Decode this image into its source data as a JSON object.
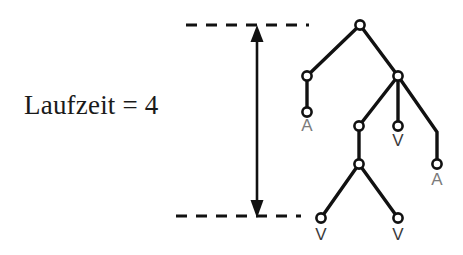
{
  "figure": {
    "background_color": "#ffffff",
    "ink_color": "#111111",
    "caption": {
      "text": "Laufzeit = 4",
      "x": 24,
      "y": 90
    },
    "depth_indicator": {
      "arrow_x": 257,
      "arrow_top_y": 27,
      "arrow_bottom_y": 217,
      "double_headed": true,
      "top_dashed_line": {
        "x1": 186,
        "x2": 309,
        "y": 25
      },
      "bottom_dashed_line": {
        "x1": 176,
        "x2": 301,
        "y": 216
      }
    },
    "tree": {
      "node_radius": 4.6,
      "nodes": [
        {
          "id": "root",
          "x": 360,
          "y": 25,
          "label": ""
        },
        {
          "id": "n-left",
          "x": 307,
          "y": 76,
          "label": ""
        },
        {
          "id": "n-right",
          "x": 398,
          "y": 76,
          "label": ""
        },
        {
          "id": "leaf-a-left",
          "x": 307,
          "y": 112,
          "label": "A",
          "label_color": "#7b7b7b"
        },
        {
          "id": "n-mid",
          "x": 359,
          "y": 126,
          "label": ""
        },
        {
          "id": "leaf-v-mid",
          "x": 398,
          "y": 126,
          "label": "V",
          "label_color": "#3b3b3b"
        },
        {
          "id": "n-lower",
          "x": 359,
          "y": 164,
          "label": ""
        },
        {
          "id": "leaf-a-right",
          "x": 437,
          "y": 164,
          "label": "A",
          "label_color": "#7b7b7b"
        },
        {
          "id": "leaf-v-bottom-left",
          "x": 321,
          "y": 218,
          "label": "V",
          "label_color": "#3b3b3b"
        },
        {
          "id": "leaf-v-bottom-right",
          "x": 398,
          "y": 218,
          "label": "V",
          "label_color": "#3b3b3b"
        }
      ],
      "edges": [
        {
          "from": "root",
          "to": "n-left"
        },
        {
          "from": "root",
          "to": "n-right"
        },
        {
          "from": "n-left",
          "to": "leaf-a-left"
        },
        {
          "from": "n-right",
          "to": "n-mid"
        },
        {
          "from": "n-right",
          "to": "leaf-v-mid"
        },
        {
          "from": "n-right",
          "to": "leaf-a-right",
          "bend": {
            "x": 437,
            "y": 132
          }
        },
        {
          "from": "n-mid",
          "to": "n-lower"
        },
        {
          "from": "n-lower",
          "to": "leaf-v-bottom-left"
        },
        {
          "from": "n-lower",
          "to": "leaf-v-bottom-right"
        }
      ],
      "labels": [
        {
          "for": "leaf-a-left",
          "text": "A",
          "x": 307,
          "y": 131,
          "color": "#7b7b7b"
        },
        {
          "for": "leaf-v-mid",
          "text": "V",
          "x": 398,
          "y": 146,
          "color": "#3b3b3b"
        },
        {
          "for": "leaf-a-right",
          "text": "A",
          "x": 437,
          "y": 185,
          "color": "#7b7b7b"
        },
        {
          "for": "leaf-v-bottom-left",
          "text": "V",
          "x": 321,
          "y": 240,
          "color": "#3b3b3b"
        },
        {
          "for": "leaf-v-bottom-right",
          "text": "V",
          "x": 398,
          "y": 240,
          "color": "#3b3b3b"
        }
      ]
    }
  }
}
